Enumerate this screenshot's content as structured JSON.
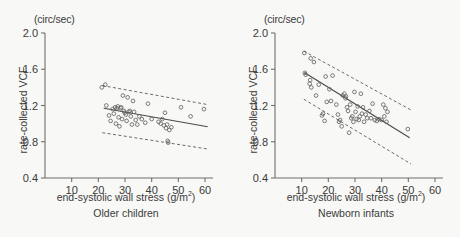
{
  "figure": {
    "unit_label": "(circ/sec)",
    "ylabel": "rate-collected VCF",
    "xlabel_text": "end-systolic wall stress  (g/m",
    "xlabel_sup": "2",
    "xlabel_tail": ")",
    "line_color": "#4a4a4a",
    "marker_color": "#636363",
    "axis_color": "#6f6f6f",
    "background": "#f8f8f6"
  },
  "chart_data": [
    {
      "type": "scatter",
      "title": "Older children",
      "xlabel": "end-systolic wall stress (g/m2)",
      "ylabel": "rate-collected VCF",
      "yunit": "circ/sec",
      "xlim": [
        0,
        63
      ],
      "ylim": [
        0.4,
        2.0
      ],
      "xticks": [
        10,
        20,
        30,
        40,
        50,
        60
      ],
      "yticks": [
        0.4,
        0.8,
        1.2,
        1.6,
        2.0
      ],
      "xtick_labels": [
        "10",
        "20",
        "30",
        "40",
        "50",
        "60"
      ],
      "ytick_labels": [
        "0.4",
        "0.8",
        "1.2",
        "1.6",
        "2.0"
      ],
      "grid": false,
      "legend": "none",
      "points": [
        [
          21.3,
          1.4
        ],
        [
          22.6,
          1.43
        ],
        [
          23.0,
          1.2
        ],
        [
          24.0,
          1.09
        ],
        [
          24.6,
          1.03
        ],
        [
          25.4,
          1.16
        ],
        [
          25.8,
          1.11
        ],
        [
          26.3,
          1.18
        ],
        [
          26.6,
          1.0
        ],
        [
          27.0,
          1.17
        ],
        [
          27.3,
          1.19
        ],
        [
          27.6,
          1.07
        ],
        [
          27.9,
          0.97
        ],
        [
          28.3,
          1.17
        ],
        [
          28.6,
          1.18
        ],
        [
          28.9,
          1.05
        ],
        [
          29.2,
          1.31
        ],
        [
          29.6,
          1.14
        ],
        [
          29.9,
          1.12
        ],
        [
          30.3,
          1.1
        ],
        [
          30.6,
          1.03
        ],
        [
          31.0,
          1.29
        ],
        [
          31.4,
          1.13
        ],
        [
          31.8,
          1.14
        ],
        [
          32.2,
          1.08
        ],
        [
          32.6,
          0.99
        ],
        [
          33.0,
          1.25
        ],
        [
          33.4,
          1.13
        ],
        [
          34.0,
          1.04
        ],
        [
          34.6,
          0.99
        ],
        [
          35.4,
          1.08
        ],
        [
          36.3,
          1.05
        ],
        [
          37.6,
          1.01
        ],
        [
          38.6,
          1.22
        ],
        [
          40.0,
          1.05
        ],
        [
          42.6,
          1.02
        ],
        [
          43.4,
          1.0
        ],
        [
          44.0,
          1.05
        ],
        [
          44.6,
          0.98
        ],
        [
          45.0,
          1.12
        ],
        [
          45.4,
          0.95
        ],
        [
          45.8,
          0.99
        ],
        [
          46.0,
          0.81
        ],
        [
          46.2,
          0.79
        ],
        [
          46.6,
          0.93
        ],
        [
          47.4,
          0.96
        ],
        [
          51.0,
          1.18
        ],
        [
          54.6,
          1.08
        ],
        [
          59.6,
          1.16
        ]
      ],
      "regression_line": {
        "x": [
          22.0,
          61.0
        ],
        "y": [
          1.17,
          0.965
        ]
      },
      "upper_bound": {
        "x": [
          21.5,
          61.0
        ],
        "y": [
          1.42,
          1.21
        ]
      },
      "lower_bound": {
        "x": [
          21.5,
          61.0
        ],
        "y": [
          0.9,
          0.72
        ]
      }
    },
    {
      "type": "scatter",
      "title": "Newborn infants",
      "xlabel": "end-systolic wall stress (g/m2)",
      "ylabel": "rate-collected VCF",
      "yunit": "circ/sec",
      "xlim": [
        0,
        63
      ],
      "ylim": [
        0.4,
        2.0
      ],
      "xticks": [
        10,
        20,
        30,
        40,
        50,
        60
      ],
      "yticks": [
        0.4,
        0.8,
        1.2,
        1.6,
        2.0
      ],
      "xtick_labels": [
        "10",
        "20",
        "30",
        "40",
        "50",
        "60"
      ],
      "ytick_labels": [
        "0.4",
        "0.8",
        "1.2",
        "1.6",
        "2.0"
      ],
      "grid": false,
      "legend": "none",
      "points": [
        [
          11.0,
          1.78
        ],
        [
          11.2,
          1.56
        ],
        [
          11.5,
          1.54
        ],
        [
          13.0,
          1.44
        ],
        [
          13.2,
          1.48
        ],
        [
          13.4,
          1.72
        ],
        [
          13.6,
          1.4
        ],
        [
          14.6,
          1.68
        ],
        [
          15.4,
          1.31
        ],
        [
          16.4,
          1.43
        ],
        [
          17.6,
          1.09
        ],
        [
          18.0,
          1.11
        ],
        [
          18.6,
          1.03
        ],
        [
          19.0,
          1.52
        ],
        [
          19.4,
          1.24
        ],
        [
          20.4,
          1.38
        ],
        [
          21.0,
          1.25
        ],
        [
          21.6,
          1.53
        ],
        [
          23.0,
          1.21
        ],
        [
          23.6,
          1.1
        ],
        [
          24.0,
          1.02
        ],
        [
          24.4,
          1.04
        ],
        [
          25.0,
          0.97
        ],
        [
          25.4,
          1.31
        ],
        [
          26.0,
          1.33
        ],
        [
          26.4,
          1.28
        ],
        [
          26.6,
          1.3
        ],
        [
          27.0,
          1.18
        ],
        [
          27.4,
          1.14
        ],
        [
          27.8,
          0.9
        ],
        [
          28.2,
          1.21
        ],
        [
          28.6,
          1.06
        ],
        [
          29.0,
          1.08
        ],
        [
          29.4,
          1.02
        ],
        [
          29.8,
          1.35
        ],
        [
          30.2,
          1.13
        ],
        [
          30.6,
          1.05
        ],
        [
          31.0,
          1.19
        ],
        [
          31.4,
          1.04
        ],
        [
          31.8,
          1.08
        ],
        [
          32.2,
          1.33
        ],
        [
          32.6,
          1.11
        ],
        [
          33.0,
          1.18
        ],
        [
          33.4,
          1.02
        ],
        [
          34.0,
          1.1
        ],
        [
          34.6,
          1.06
        ],
        [
          35.4,
          1.14
        ],
        [
          36.0,
          1.06
        ],
        [
          36.6,
          1.22
        ],
        [
          37.4,
          1.04
        ],
        [
          38.2,
          1.03
        ],
        [
          39.0,
          1.05
        ],
        [
          40.0,
          1.04
        ],
        [
          40.6,
          1.21
        ],
        [
          41.0,
          1.08
        ],
        [
          41.4,
          1.17
        ],
        [
          41.8,
          1.02
        ],
        [
          42.2,
          1.13
        ],
        [
          49.8,
          0.94
        ]
      ],
      "regression_line": {
        "x": [
          11.0,
          50.5
        ],
        "y": [
          1.565,
          0.845
        ]
      },
      "upper_bound": {
        "x": [
          10.8,
          51.0
        ],
        "y": [
          1.8,
          1.15
        ]
      },
      "lower_bound": {
        "x": [
          10.8,
          51.0
        ],
        "y": [
          1.27,
          0.555
        ]
      }
    }
  ]
}
